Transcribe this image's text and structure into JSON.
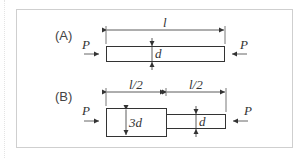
{
  "figure": {
    "panel_a": {
      "label": "(A)",
      "length_label": "l",
      "diameter_label": "d",
      "load_left": "P",
      "load_right": "P"
    },
    "panel_b": {
      "label": "(B)",
      "length_left_label": "l/2",
      "length_right_label": "l/2",
      "diameter_large_label": "3d",
      "diameter_small_label": "d",
      "load_left": "P",
      "load_right": "P"
    },
    "colors": {
      "frame": "#cfcfcf",
      "line": "#333333",
      "arrow": "#555555"
    }
  }
}
